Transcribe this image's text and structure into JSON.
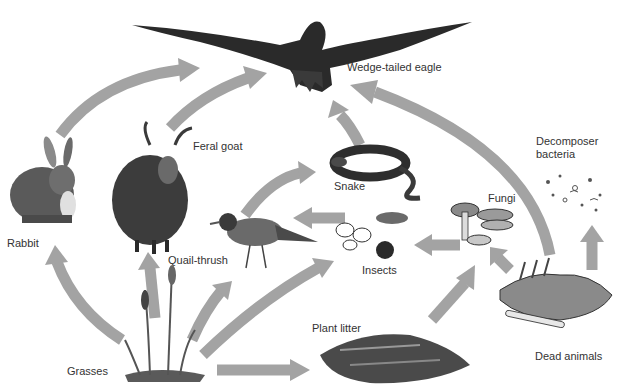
{
  "diagram": {
    "type": "food-web",
    "colors": {
      "arrow": "#a3a3a3",
      "label": "#333333",
      "illustration_dark": "#2a2a2a",
      "illustration_mid": "#6e6e6e",
      "background": "#ffffff"
    },
    "nodes": [
      {
        "id": "eagle",
        "label": "Wedge-tailed eagle"
      },
      {
        "id": "goat",
        "label": "Feral goat"
      },
      {
        "id": "rabbit",
        "label": "Rabbit"
      },
      {
        "id": "snake",
        "label": "Snake"
      },
      {
        "id": "quailthrush",
        "label": "Quail-thrush"
      },
      {
        "id": "insects",
        "label": "Insects"
      },
      {
        "id": "fungi",
        "label": "Fungi"
      },
      {
        "id": "bacteria",
        "label": "Decomposer\nbacteria",
        "lines": [
          "Decomposer",
          "bacteria"
        ]
      },
      {
        "id": "plantlitter",
        "label": "Plant litter"
      },
      {
        "id": "grasses",
        "label": "Grasses"
      },
      {
        "id": "deadanimals",
        "label": "Dead animals"
      }
    ],
    "edges": [
      {
        "from": "grasses",
        "to": "rabbit"
      },
      {
        "from": "grasses",
        "to": "goat"
      },
      {
        "from": "grasses",
        "to": "quailthrush"
      },
      {
        "from": "grasses",
        "to": "insects"
      },
      {
        "from": "grasses",
        "to": "plantlitter"
      },
      {
        "from": "rabbit",
        "to": "eagle"
      },
      {
        "from": "goat",
        "to": "eagle"
      },
      {
        "from": "snake",
        "to": "eagle"
      },
      {
        "from": "deadanimals",
        "to": "eagle"
      },
      {
        "from": "quailthrush",
        "to": "snake"
      },
      {
        "from": "insects",
        "to": "quailthrush"
      },
      {
        "from": "fungi",
        "to": "insects"
      },
      {
        "from": "plantlitter",
        "to": "fungi"
      },
      {
        "from": "deadanimals",
        "to": "fungi"
      },
      {
        "from": "deadanimals",
        "to": "bacteria"
      }
    ]
  }
}
